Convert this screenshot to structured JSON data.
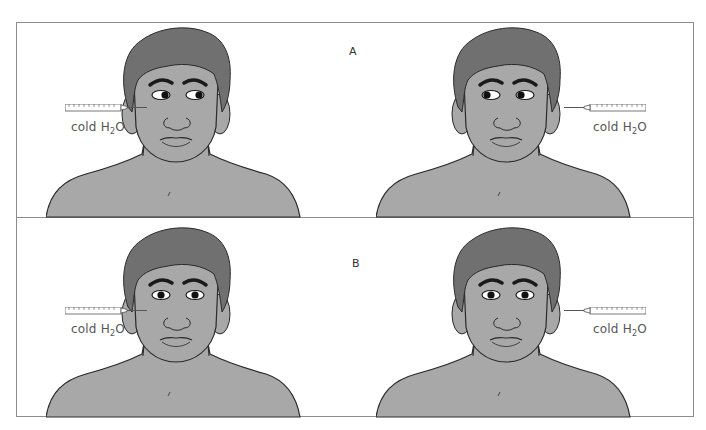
{
  "figure": {
    "colors": {
      "skin": "#a8a8a8",
      "hair": "#707070",
      "outline": "#2a2a2a",
      "border": "#8c8c8c",
      "label_text": "#555555"
    },
    "panels": [
      {
        "label": "A",
        "figures": [
          {
            "side": "left",
            "irrigated_ear": "right-of-patient (viewer left)",
            "gaze": "toward viewer right",
            "syringe_label_main": "cold H",
            "syringe_label_sub": "2",
            "syringe_label_tail": "O"
          },
          {
            "side": "right",
            "irrigated_ear": "left-of-patient (viewer right)",
            "gaze": "toward viewer left",
            "syringe_label_main": "cold H",
            "syringe_label_sub": "2",
            "syringe_label_tail": "O"
          }
        ]
      },
      {
        "label": "B",
        "figures": [
          {
            "side": "left",
            "irrigated_ear": "right-of-patient (viewer left)",
            "gaze": "straight ahead",
            "syringe_label_main": "cold H",
            "syringe_label_sub": "2",
            "syringe_label_tail": "O"
          },
          {
            "side": "right",
            "irrigated_ear": "left-of-patient (viewer right)",
            "gaze": "straight ahead",
            "syringe_label_main": "cold H",
            "syringe_label_sub": "2",
            "syringe_label_tail": "O"
          }
        ]
      }
    ]
  }
}
